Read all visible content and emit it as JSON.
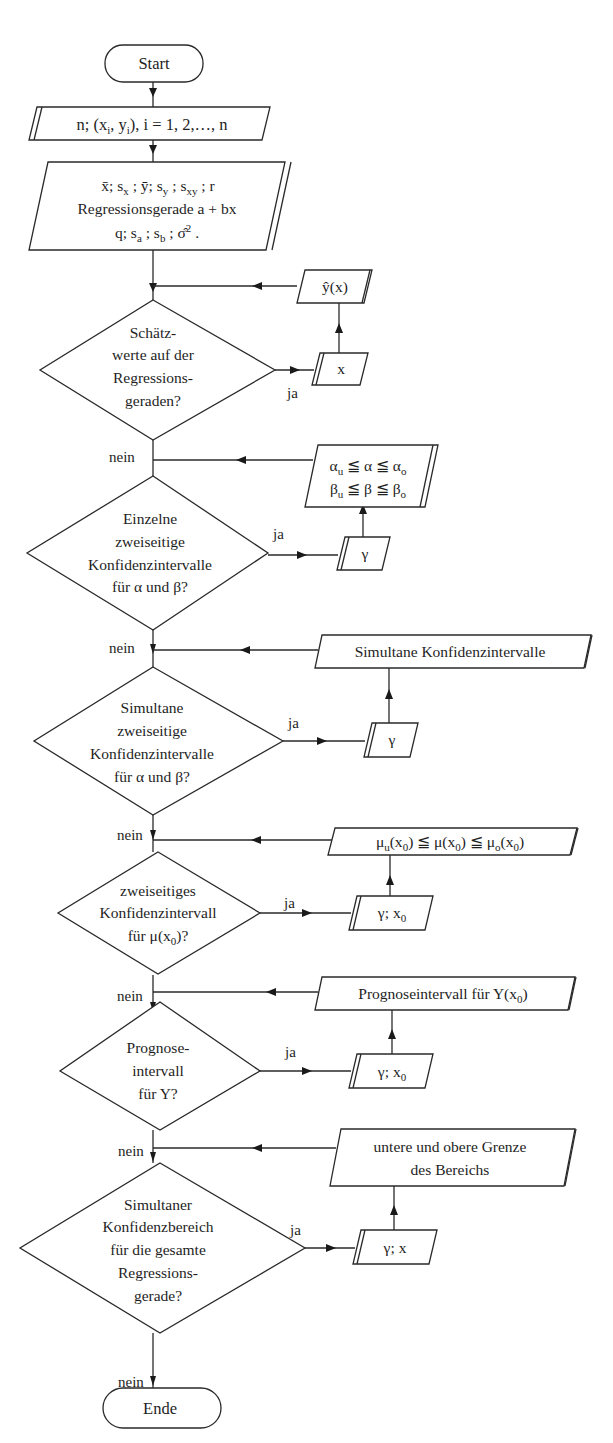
{
  "diagram": {
    "type": "flowchart",
    "colors": {
      "line": "#2a2a2a",
      "text": "#1e1e1e",
      "background": "#ffffff"
    },
    "start": {
      "label": "Start"
    },
    "end": {
      "label": "Ende"
    },
    "input_data": {
      "label": "n; (xi, yi), i = 1, 2,…, n"
    },
    "output_stats": {
      "lines": [
        "x̄; sx ; ȳ; sy ; sxy ; r",
        "Regressionsgerade a + bx",
        "q; sa ; sb ; σ̂²."
      ]
    },
    "branch_labels": {
      "yes": "ja",
      "no": "nein"
    },
    "decisions": [
      {
        "id": "schaetzwerte",
        "lines": [
          "Schätz-",
          "werte auf der",
          "Regressions-",
          "geraden?"
        ],
        "input": "x",
        "output": [
          "ŷ(x)"
        ]
      },
      {
        "id": "einzelne-ki",
        "lines": [
          "Einzelne",
          "zweiseitige",
          "Konfidenzintervalle",
          "für α und β?"
        ],
        "input": "γ",
        "output": [
          "αu ≦ α ≦ αo",
          "βu ≦ β ≦ βo"
        ]
      },
      {
        "id": "simultane-ki",
        "lines": [
          "Simultane",
          "zweiseitige",
          "Konfidenzintervalle",
          "für α und β?"
        ],
        "input": "γ",
        "output": [
          "Simultane Konfidenzintervalle"
        ]
      },
      {
        "id": "ki-mu",
        "lines": [
          "zweiseitiges",
          "Konfidenzintervall",
          "für μ(x0)?"
        ],
        "input": "γ; x0",
        "output": [
          "μu(x0) ≦ μ(x0) ≦ μo(x0)"
        ]
      },
      {
        "id": "prognose",
        "lines": [
          "Prognose-",
          "intervall",
          "für Y?"
        ],
        "input": "γ; x0",
        "output": [
          "Prognoseintervall für Y(x0)"
        ]
      },
      {
        "id": "konfidenzbereich",
        "lines": [
          "Simultaner",
          "Konfidenzbereich",
          "für die gesamte",
          "Regressions-",
          "gerade?"
        ],
        "input": "γ; x",
        "output": [
          "untere und obere Grenze",
          "des Bereichs"
        ]
      }
    ]
  }
}
